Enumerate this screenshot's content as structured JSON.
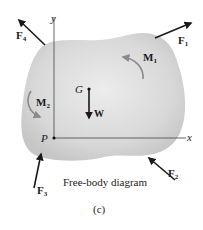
{
  "diagram": {
    "caption": "Free-body diagram",
    "figure_label": "(c)",
    "axes": {
      "x_label": "x",
      "y_label": "y"
    },
    "points": {
      "origin": "P",
      "center_of_gravity": "G"
    },
    "forces": [
      {
        "name": "F",
        "sub": "4",
        "direction": "up-left"
      },
      {
        "name": "F",
        "sub": "1",
        "direction": "up-right"
      },
      {
        "name": "F",
        "sub": "3",
        "direction": "up"
      },
      {
        "name": "F",
        "sub": "2",
        "direction": "up-left"
      }
    ],
    "weight": {
      "name": "W",
      "direction": "down"
    },
    "moments": [
      {
        "name": "M",
        "sub": "1",
        "sense": "counterclockwise"
      },
      {
        "name": "M",
        "sub": "2",
        "sense": "counterclockwise"
      }
    ],
    "colors": {
      "body_fill": "#cfcfcf",
      "body_center": "#e6e6e6",
      "arrow": "#1a1a1a",
      "moment_arrow": "#8a8a8a",
      "axis": "#555555"
    }
  }
}
